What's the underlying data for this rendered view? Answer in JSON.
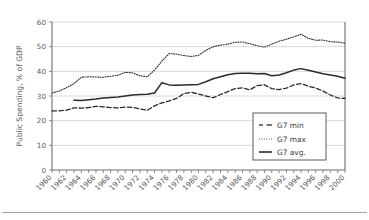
{
  "chart_data": {
    "type": "line",
    "title": "",
    "xlabel": "",
    "ylabel": "Public Spending, % of GDP",
    "xlim": [
      1960,
      2000
    ],
    "ylim": [
      0,
      60
    ],
    "yticks": [
      0,
      10,
      20,
      30,
      40,
      50,
      60
    ],
    "grid": true,
    "legend_position": "bottom-right",
    "x": [
      1960,
      1961,
      1962,
      1963,
      1964,
      1965,
      1966,
      1967,
      1968,
      1969,
      1970,
      1971,
      1972,
      1973,
      1974,
      1975,
      1976,
      1977,
      1978,
      1979,
      1980,
      1981,
      1982,
      1983,
      1984,
      1985,
      1986,
      1987,
      1988,
      1989,
      1990,
      1991,
      1992,
      1993,
      1994,
      1995,
      1996,
      1997,
      1998,
      1999,
      2000
    ],
    "xtick_labels": [
      "1960",
      "1962",
      "1964",
      "1966",
      "1968",
      "1970",
      "1972",
      "1974",
      "1976",
      "1978",
      "1980",
      "1982",
      "1984",
      "1986",
      "1988",
      "1990",
      "1992",
      "1994",
      "1996",
      "1998",
      "2000"
    ],
    "series": [
      {
        "name": "G7 min",
        "style": "dashed",
        "color": "#2b2b2b",
        "values": [
          24.0,
          24.0,
          24.3,
          25.2,
          25.1,
          25.3,
          25.8,
          25.6,
          25.3,
          25.2,
          25.5,
          25.4,
          24.8,
          24.2,
          26.0,
          27.2,
          28.0,
          29.0,
          31.0,
          31.5,
          30.8,
          30.0,
          29.3,
          30.6,
          31.8,
          33.0,
          33.3,
          32.5,
          34.2,
          34.5,
          33.0,
          32.6,
          33.2,
          34.5,
          35.0,
          34.0,
          33.2,
          32.0,
          30.4,
          29.2,
          29.0
        ]
      },
      {
        "name": "G7 max",
        "style": "dotted",
        "color": "#555555",
        "values": [
          31.2,
          32.0,
          33.4,
          35.0,
          37.6,
          37.8,
          37.7,
          37.6,
          38.0,
          38.4,
          39.6,
          39.4,
          38.2,
          37.8,
          40.5,
          44.2,
          47.2,
          47.0,
          46.4,
          46.0,
          46.5,
          48.5,
          50.0,
          50.6,
          51.0,
          51.8,
          51.9,
          51.2,
          50.4,
          49.8,
          51.0,
          52.2,
          53.0,
          54.0,
          55.0,
          53.4,
          52.6,
          52.7,
          52.0,
          51.9,
          51.4
        ]
      },
      {
        "name": "G7 avg.",
        "style": "solid",
        "color": "#1f1f1f",
        "values": [
          null,
          null,
          null,
          28.3,
          28.2,
          28.5,
          28.8,
          29.2,
          29.4,
          29.6,
          30.0,
          30.4,
          30.6,
          30.7,
          31.2,
          35.4,
          34.5,
          34.4,
          34.5,
          34.6,
          34.7,
          35.8,
          37.0,
          37.8,
          38.6,
          39.1,
          39.2,
          39.2,
          39.0,
          39.1,
          38.2,
          38.5,
          39.4,
          40.5,
          41.1,
          40.4,
          39.7,
          39.0,
          38.5,
          38.0,
          37.2
        ]
      }
    ]
  },
  "legend": {
    "items": [
      {
        "label": "G7 min"
      },
      {
        "label": "G7 max"
      },
      {
        "label": "G7 avg."
      }
    ]
  }
}
